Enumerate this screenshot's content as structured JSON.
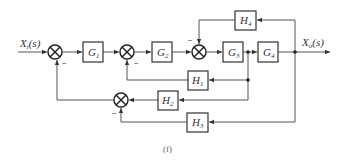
{
  "diagram": {
    "type": "block-diagram",
    "caption": "(f)",
    "input": {
      "label": "X",
      "sub": "i",
      "arg": "(s)"
    },
    "output": {
      "label": "X",
      "sub": "o",
      "arg": "(s)"
    },
    "blocks": {
      "G1": {
        "label": "G",
        "sub": "1"
      },
      "G2": {
        "label": "G",
        "sub": "2"
      },
      "G3": {
        "label": "G",
        "sub": "3"
      },
      "G4": {
        "label": "G",
        "sub": "4"
      },
      "H1": {
        "label": "H",
        "sub": "1"
      },
      "H2": {
        "label": "H",
        "sub": "2"
      },
      "H3": {
        "label": "H",
        "sub": "3"
      },
      "H4": {
        "label": "H",
        "sub": "4"
      }
    },
    "signs": {
      "sum1": "−",
      "sum2": "−",
      "sum3": "−",
      "sum4": "−"
    },
    "connections": [
      "X_i(s) -> sum1(+)",
      "sum1 -> G1 -> sum2(+)",
      "sum2 -> G2 -> sum3(+)",
      "sum3 -> G3 -> node_a -> G4 -> X_o(s)",
      "X_o(s) -> H4 -> sum3(−)",
      "node_a -> H1 -> sum2(−)",
      "node_a -> H2 -> sum4(+)",
      "X_o(s) -> H3 -> sum4(−)",
      "sum4 -> sum1(−)"
    ]
  }
}
